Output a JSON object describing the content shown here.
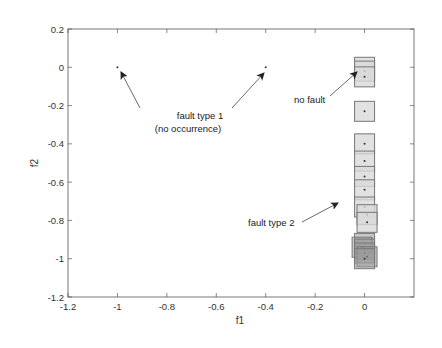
{
  "chart_data": {
    "type": "scatter",
    "title": "",
    "xlabel": "f1",
    "ylabel": "f2",
    "xlim": [
      -1.2,
      0.2
    ],
    "ylim": [
      -1.2,
      0.2
    ],
    "xticks": [
      -1.2,
      -1,
      -0.8,
      -0.6,
      -0.4,
      -0.2,
      0
    ],
    "xtick_labels": [
      "-1.2",
      "-1",
      "-0.8",
      "-0.6",
      "-0.4",
      "-0.2",
      "0"
    ],
    "yticks": [
      0.2,
      0,
      -0.2,
      -0.4,
      -0.6,
      -0.8,
      -1,
      -1.2
    ],
    "ytick_labels": [
      "0.2",
      "0",
      "-0.2",
      "-0.4",
      "-0.6",
      "-0.8",
      "-1",
      "-1.2"
    ],
    "grid": false,
    "legend": null,
    "series": [
      {
        "name": "fault type 1 (no occurrence)",
        "marker": "dot",
        "points": [
          [
            -1.0,
            0.0
          ],
          [
            -0.4,
            0.0
          ]
        ]
      },
      {
        "name": "no fault",
        "marker": "dot-in-square",
        "points": [
          [
            0.0,
            0.0
          ],
          [
            0.0,
            -0.02
          ],
          [
            0.0,
            -0.05
          ]
        ]
      },
      {
        "name": "other samples",
        "marker": "dot-in-square",
        "points": [
          [
            0.0,
            -0.23
          ],
          [
            0.0,
            -0.4
          ],
          [
            0.0,
            -0.49
          ],
          [
            0.0,
            -0.57
          ],
          [
            0.0,
            -0.64
          ]
        ]
      },
      {
        "name": "fault type 2",
        "marker": "dot-in-square",
        "points": [
          [
            0.0,
            -0.73
          ],
          [
            0.01,
            -0.77
          ],
          [
            0.01,
            -0.81
          ],
          [
            0.0,
            -0.92
          ],
          [
            -0.01,
            -0.94
          ],
          [
            0.0,
            -0.95
          ],
          [
            0.0,
            -0.97
          ],
          [
            0.01,
            -0.99
          ],
          [
            0.0,
            -1.0
          ]
        ]
      }
    ],
    "annotations": [
      {
        "text": "fault type 1",
        "x": -0.55,
        "y": -0.25,
        "arrows_to": [
          [
            -1.0,
            0.0
          ],
          [
            -0.4,
            0.0
          ]
        ]
      },
      {
        "text": "(no occurrence)",
        "x": -0.55,
        "y": -0.32
      },
      {
        "text": "no fault",
        "x": -0.13,
        "y": -0.21,
        "arrow_to": [
          0.0,
          -0.02
        ]
      },
      {
        "text": "fault type 2",
        "x": -0.18,
        "y": -0.82,
        "arrow_to": [
          -0.05,
          -0.72
        ]
      }
    ]
  },
  "labels": {
    "xlabel": "f1",
    "ylabel": "f2",
    "annot_fault1_line1": "fault type 1",
    "annot_fault1_line2": "(no occurrence)",
    "annot_nofault": "no fault",
    "annot_fault2": "fault type 2"
  },
  "colors": {
    "axis": "#555555",
    "square_fill": "#d9d9d9",
    "square_stroke": "#777777",
    "dark_square_fill": "#9a9a9a",
    "arrow": "#333333"
  }
}
